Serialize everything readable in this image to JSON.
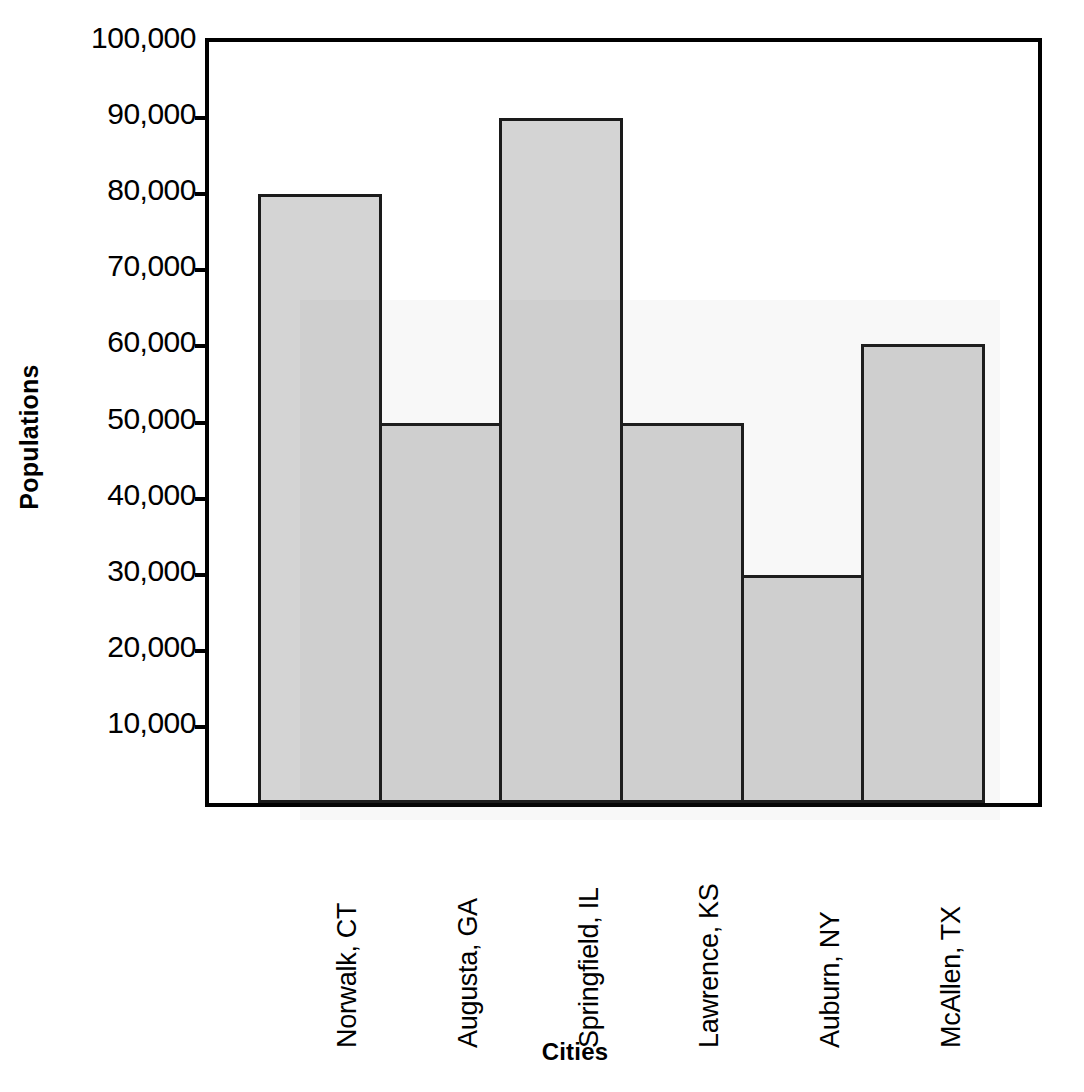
{
  "chart_data": {
    "type": "bar",
    "title": "",
    "xlabel": "Cities",
    "ylabel": "Populations",
    "categories": [
      "Norwalk, CT",
      "Augusta, GA",
      "Springfield, IL",
      "Lawrence, KS",
      "Auburn, NY",
      "McAllen, TX"
    ],
    "values": [
      80000,
      50000,
      90000,
      50000,
      30000,
      60300
    ],
    "ylim": [
      0,
      100000
    ],
    "yticks": [
      0,
      10000,
      20000,
      30000,
      40000,
      50000,
      60000,
      70000,
      80000,
      90000,
      100000
    ],
    "ytick_labels": [
      "",
      "10,000",
      "20,000",
      "30,000",
      "40,000",
      "50,000",
      "60,000",
      "70,000",
      "80,000",
      "90,000",
      "100,000"
    ],
    "grid": false,
    "legend": null,
    "bar_fill_color": "#d4d4d4",
    "bar_edge_color": "#1a1a1a",
    "axis_color": "#000000",
    "background_color": "#ffffff"
  }
}
